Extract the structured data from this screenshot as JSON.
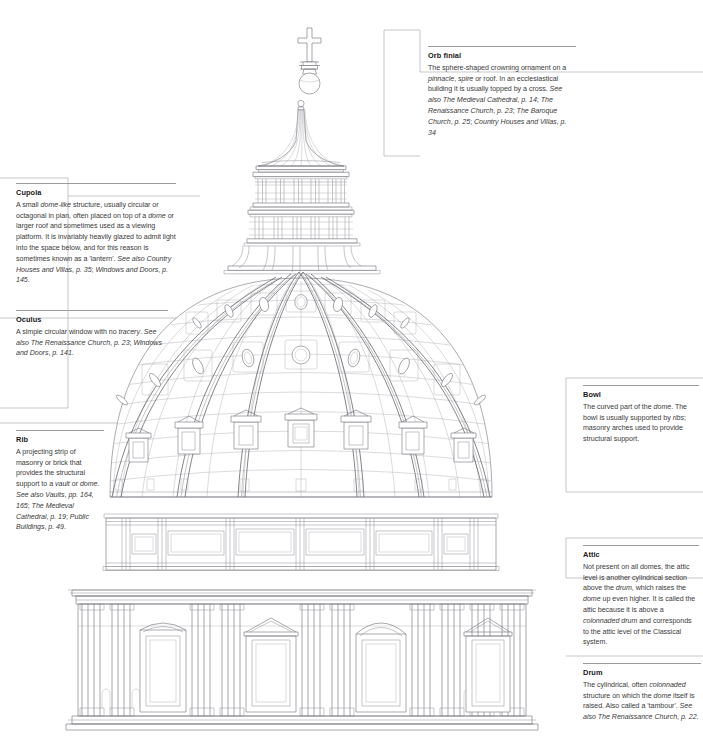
{
  "diagram": {
    "subject": "Dome",
    "style": "architectural line drawing, elevation of a Renaissance/Baroque dome",
    "line_color": "#6f6f78",
    "rule_color": "#9a9a9a",
    "text_color": "#3a3a3a",
    "heading_color": "#1a1a1a",
    "background": "#ffffff"
  },
  "callouts": [
    {
      "id": "orb-finial",
      "title": "Orb finial",
      "body": "The sphere-shaped crowning ornament on a pinnacle, spire or roof. In an ecclesiastical building it is usually topped by a cross. See also The Medieval Cathedral, p. 14; The Renaissance Church, p. 23; The Baroque Church, p. 25; Country Houses and Villas, p. 34"
    },
    {
      "id": "cupola",
      "title": "Cupola",
      "body": "A small dome-like structure, usually circular or octagonal in plan, often placed on top of a dome or larger roof and sometimes used as a viewing platform. It is invariably heavily glazed to admit light into the space below, and for this reason is sometimes known as a 'lantern'. See also Country Houses and Villas, p. 35; Windows and Doors, p. 145."
    },
    {
      "id": "oculus",
      "title": "Oculus",
      "body": "A simple circular window with no tracery. See also The Renaissance Church, p. 23; Windows and Doors, p. 141."
    },
    {
      "id": "rib",
      "title": "Rib",
      "body": "A projecting strip of masonry or brick that provides the structural support to a vault or dome. See also Vaults, pp. 164, 165; The Medieval Cathedral, p. 19; Public Buildings, p. 49."
    },
    {
      "id": "bowl",
      "title": "Bowl",
      "body": "The curved part of the dome. The bowl is usually supported by ribs; masonry arches used to provide structural support."
    },
    {
      "id": "attic",
      "title": "Attic",
      "body": "Not present on all domes, the attic level is another cylindrical section above the drum, which raises the dome up even higher. It is called the attic because it is above a colonnaded drum and corresponds to the attic level of the Classical system."
    },
    {
      "id": "drum",
      "title": "Drum",
      "body": "The cylindrical, often colonnaded structure on which the dome itself is raised. Also called a 'tambour'. See also The Renaissance Church, p. 22."
    }
  ]
}
